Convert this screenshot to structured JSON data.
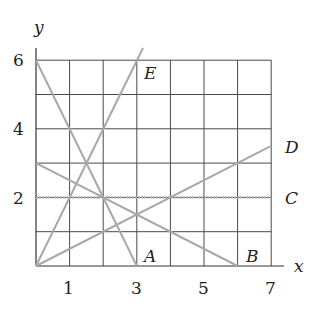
{
  "diagram": {
    "axes": {
      "x_label": "x",
      "y_label": "y"
    },
    "x_ticks": [
      "1",
      "3",
      "5",
      "7"
    ],
    "y_ticks": [
      "2",
      "4",
      "6"
    ],
    "grid": {
      "x_range": [
        0,
        7
      ],
      "y_range": [
        0,
        6
      ],
      "step": 1
    },
    "colors": {
      "grid": "#4a4a4a",
      "lines": "#a8a8a8",
      "text": "#222222"
    },
    "lines": [
      {
        "label": "A",
        "from": [
          0,
          6
        ],
        "to": [
          3,
          0
        ]
      },
      {
        "label": "B",
        "from": [
          0,
          3
        ],
        "to": [
          6,
          0
        ]
      },
      {
        "label": "C",
        "from": [
          0,
          2
        ],
        "to": [
          7,
          2
        ]
      },
      {
        "label": "D",
        "from": [
          0,
          0
        ],
        "to": [
          7,
          3.5
        ]
      },
      {
        "label": "E",
        "from": [
          0,
          0
        ],
        "to": [
          3.25,
          6.5
        ]
      }
    ]
  }
}
